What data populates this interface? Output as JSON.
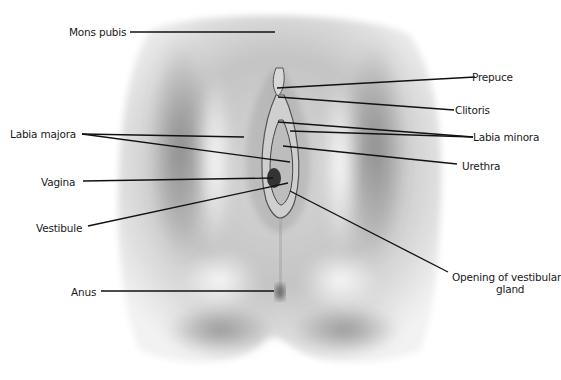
{
  "figure": {
    "labels": {
      "mons_pubis": "Mons pubis",
      "prepuce": "Prepuce",
      "clitoris": "Clitoris",
      "labia_majora": "Labia majora",
      "labia_minora": "Labia minora",
      "urethra": "Urethra",
      "vagina": "Vagina",
      "vestibule": "Vestibule",
      "anus": "Anus",
      "vestibular_gland_line1": "Opening of vestibular",
      "vestibular_gland_line2": "gland"
    },
    "colors": {
      "background": "#ffffff",
      "leader_line": "#111111",
      "label_text": "#1a1a1a"
    }
  }
}
